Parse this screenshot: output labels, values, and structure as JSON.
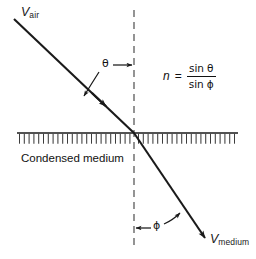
{
  "figure": {
    "background_color": "#ffffff",
    "ink_color": "#1a1a1a"
  },
  "labels": {
    "incident_velocity": {
      "symbol": "V",
      "subscript": "air"
    },
    "refracted_velocity": {
      "symbol": "V",
      "subscript": "medium"
    },
    "incidence_angle": "θ",
    "refraction_angle": "ϕ",
    "medium_caption": "Condensed medium"
  },
  "formula": {
    "variable": "n",
    "equals": "=",
    "numerator_fn": "sin",
    "numerator_angle": "θ",
    "denominator_fn": "sin",
    "denominator_angle": "ϕ",
    "plain_text": "n = sin θ / sin ϕ"
  },
  "geometry": {
    "incident_ray": {
      "x1": 14,
      "y1": 19,
      "x2": 134,
      "y2": 133
    },
    "refracted_ray": {
      "x1": 134,
      "y1": 133,
      "x2": 207,
      "y2": 241
    },
    "normal_line": {
      "x": 134,
      "y1": 10,
      "y2": 250,
      "style": "dashed"
    },
    "interface_line": {
      "x1": 17,
      "y1": 133,
      "x2": 238,
      "y2": 133
    },
    "hatching": {
      "x_start": 17,
      "x_end": 238,
      "y_top": 133,
      "depth": 10,
      "count": 46
    },
    "theta_pointer": {
      "x1": 113,
      "y1": 65,
      "x2": 133,
      "y2": 65
    },
    "phi_pointer": {
      "x1": 150,
      "y1": 228,
      "x2": 136,
      "y2": 228
    }
  }
}
